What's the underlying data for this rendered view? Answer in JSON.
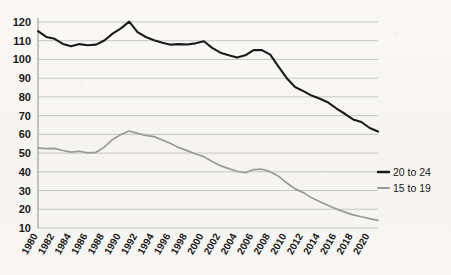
{
  "chart_data": {
    "type": "line",
    "title": "",
    "subtitle": "",
    "xlabel": "",
    "ylabel": "",
    "grid": "horizontal",
    "legend_position": "right",
    "ylim": [
      10,
      120
    ],
    "ytick_step": 10,
    "yticks": [
      10,
      20,
      30,
      40,
      50,
      60,
      70,
      80,
      90,
      100,
      110,
      120
    ],
    "ytick_labels": [
      "10",
      "20",
      "30",
      "40",
      "50",
      "60",
      "70",
      "80",
      "90",
      "100",
      "110",
      "120"
    ],
    "xlim": [
      1980,
      2021
    ],
    "xtick_step": 2,
    "x": [
      1980,
      1981,
      1982,
      1983,
      1984,
      1985,
      1986,
      1987,
      1988,
      1989,
      1990,
      1991,
      1992,
      1993,
      1994,
      1995,
      1996,
      1997,
      1998,
      1999,
      2000,
      2001,
      2002,
      2003,
      2004,
      2005,
      2006,
      2007,
      2008,
      2009,
      2010,
      2011,
      2012,
      2013,
      2014,
      2015,
      2016,
      2017,
      2018,
      2019,
      2020,
      2021
    ],
    "xticks": [
      1980,
      1982,
      1984,
      1986,
      1988,
      1990,
      1992,
      1994,
      1996,
      1998,
      2000,
      2002,
      2004,
      2006,
      2008,
      2010,
      2012,
      2014,
      2016,
      2018,
      2020
    ],
    "xtick_labels": [
      "1980",
      "1982",
      "1984",
      "1986",
      "1988",
      "1990",
      "1992",
      "1994",
      "1996",
      "1998",
      "2000",
      "2002",
      "2004",
      "2006",
      "2008",
      "2010",
      "2012",
      "2014",
      "2016",
      "2018",
      "2020"
    ],
    "xtick_rotation_deg": -60,
    "series": [
      {
        "name": "20 to 24",
        "color": "#1b1b1b",
        "values": [
          115.1,
          112.0,
          111.0,
          108.3,
          107.0,
          108.2,
          107.6,
          107.9,
          110.1,
          113.8,
          116.6,
          120.2,
          114.6,
          112.0,
          110.3,
          108.9,
          107.9,
          108.2,
          108.0,
          108.6,
          109.7,
          106.2,
          103.6,
          102.2,
          101.0,
          102.2,
          105.0,
          105.0,
          102.6,
          96.2,
          90.0,
          85.3,
          83.1,
          80.7,
          79.0,
          77.0,
          73.8,
          71.0,
          68.0,
          66.6,
          63.4,
          61.5
        ]
      },
      {
        "name": "15 to 19",
        "color": "#9a9a9a",
        "values": [
          52.8,
          52.4,
          52.5,
          51.4,
          50.5,
          51.0,
          50.1,
          50.4,
          53.2,
          57.3,
          59.9,
          61.8,
          60.5,
          59.5,
          58.8,
          57.0,
          55.1,
          52.9,
          51.3,
          49.5,
          48.1,
          45.5,
          43.3,
          41.7,
          40.3,
          39.5,
          41.2,
          41.4,
          40.1,
          37.7,
          34.0,
          30.9,
          28.9,
          26.1,
          24.0,
          22.0,
          20.1,
          18.5,
          17.0,
          16.0,
          15.0,
          14.1
        ]
      }
    ]
  },
  "legend": {
    "items": [
      {
        "label": "20 to 24",
        "color": "#1b1b1b"
      },
      {
        "label": "15 to 19",
        "color": "#9a9a9a"
      }
    ]
  }
}
